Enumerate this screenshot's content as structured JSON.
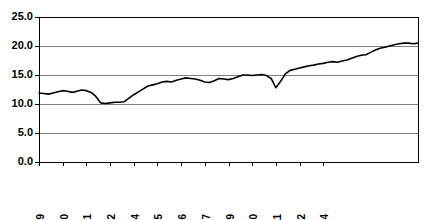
{
  "chart_data": {
    "type": "line",
    "title": "",
    "subtitle": "",
    "xlabel": "",
    "ylabel": "",
    "grid": true,
    "legend": false,
    "legend_position": "none",
    "line_color": "#000000",
    "grid_color": "#808080",
    "axis_color": "#000000",
    "ylim": [
      0.0,
      25.0
    ],
    "ytick_labels": [
      "0.0",
      "5.0",
      "10.0",
      "15.0",
      "20.0",
      "25.0"
    ],
    "ytick_values": [
      0.0,
      5.0,
      10.0,
      15.0,
      20.0,
      25.0
    ],
    "xtick_labels": [
      "Mar.1999",
      "Jun.2000",
      "Sep.2001",
      "Dec.2002",
      "Mar.2004",
      "Jun.2005",
      "Sep.2006",
      "Dec.2007",
      "Mar.2009",
      "Jun.2010",
      "Sep.2011",
      "Dec.2012",
      "Mar.2014"
    ],
    "xtick_indices": [
      0,
      5,
      10,
      15,
      20,
      25,
      30,
      35,
      40,
      45,
      50,
      55,
      60
    ],
    "x_index_count": 62,
    "series": [
      {
        "name": "value",
        "values": [
          11.9,
          11.8,
          11.7,
          11.9,
          12.1,
          12.3,
          12.2,
          12.0,
          12.2,
          12.4,
          12.3,
          12.0,
          11.3,
          10.2,
          10.1,
          10.2,
          10.3,
          10.3,
          10.4,
          11.0,
          11.6,
          12.1,
          12.6,
          13.1,
          13.3,
          13.5,
          13.8,
          13.9,
          13.8,
          14.1,
          14.3,
          14.5,
          14.4,
          14.3,
          14.1,
          13.8,
          13.7,
          14.0,
          14.4,
          14.3,
          14.2,
          14.4,
          14.7,
          15.0,
          15.0,
          14.9,
          15.0,
          15.1,
          14.9,
          14.4,
          12.8,
          13.9,
          15.2,
          15.8,
          16.0,
          16.2,
          16.4,
          16.6,
          16.7,
          16.9,
          17.0,
          17.2,
          17.3,
          17.2,
          17.4,
          17.6,
          17.9,
          18.2,
          18.4,
          18.5,
          18.9,
          19.3,
          19.6,
          19.8,
          20.0,
          20.2,
          20.4,
          20.5,
          20.5,
          20.4,
          20.5
        ]
      }
    ]
  },
  "plot_geometry": {
    "left": 39,
    "right": 418,
    "top": 17,
    "bottom": 162
  }
}
